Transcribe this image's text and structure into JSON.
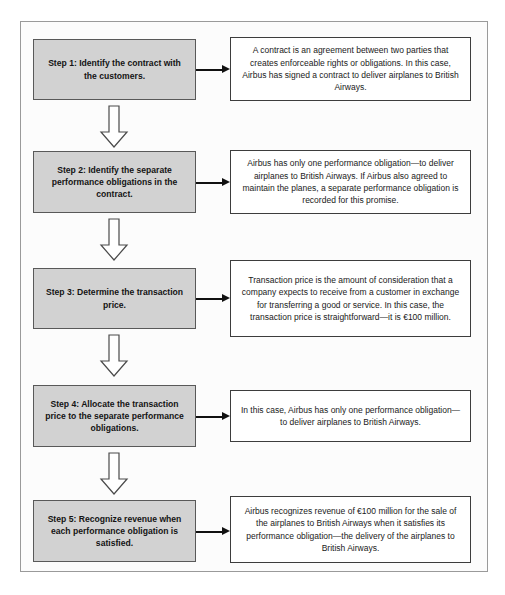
{
  "diagram": {
    "type": "flowchart",
    "orientation": "vertical",
    "title": "",
    "colors": {
      "step_box_fill": "#d2d2d2",
      "step_box_border": "#595959",
      "detail_box_fill": "#ffffff",
      "detail_box_border": "#3d3d3d",
      "frame_border": "#9a9a9a",
      "arrow": "#111111",
      "text": "#141414"
    },
    "steps": [
      {
        "id": "step-1",
        "label": "Step 1: Identify the contract with the customers.",
        "detail": "A contract is an agreement between two parties that creates enforceable rights or obligations. In this case, Airbus has signed a contract to deliver airplanes to British Airways.",
        "connector_right": "arrow-right-icon",
        "connector_down": "arrow-down-icon"
      },
      {
        "id": "step-2",
        "label": "Step 2: Identify the separate performance obligations in the contract.",
        "detail": "Airbus has only one performance obligation—to deliver airplanes to British Airways. If Airbus also agreed to maintain the planes, a separate performance obligation is recorded for this promise.",
        "connector_right": "arrow-right-icon",
        "connector_down": "arrow-down-icon"
      },
      {
        "id": "step-3",
        "label": "Step 3: Determine the transaction price.",
        "detail": "Transaction price is the amount of consideration that a company expects to receive from a customer in exchange for transferring a good or service. In this case, the transaction price is straightforward—it is €100 million.",
        "connector_right": "arrow-right-icon",
        "connector_down": "arrow-down-icon"
      },
      {
        "id": "step-4",
        "label": "Step 4: Allocate the transaction price to the separate performance obligations.",
        "detail": "In this case, Airbus has only one performance obligation—to deliver airplanes to British Airways.",
        "connector_right": "arrow-right-icon",
        "connector_down": "arrow-down-icon"
      },
      {
        "id": "step-5",
        "label": "Step 5: Recognize revenue when each performance obligation is satisfied.",
        "detail": "Airbus recognizes revenue of €100 million for the sale of the airplanes to British Airways when it satisfies its performance obligation—the delivery of the airplanes to British Airways.",
        "connector_right": "arrow-right-icon",
        "connector_down": null
      }
    ]
  }
}
